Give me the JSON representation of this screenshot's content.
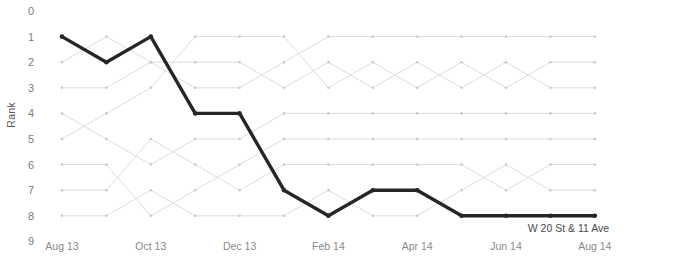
{
  "chart_data": {
    "type": "line",
    "subtype": "bump-chart",
    "title": "",
    "xlabel": "",
    "ylabel": "Rank",
    "x": [
      "Aug 13",
      "Sep 13",
      "Oct 13",
      "Nov 13",
      "Dec 13",
      "Jan 14",
      "Feb 14",
      "Mar 14",
      "Apr 14",
      "May 14",
      "Jun 14",
      "Jul 14",
      "Aug 14"
    ],
    "x_tick_labels": [
      "Aug 13",
      "Oct 13",
      "Dec 13",
      "Feb 14",
      "Apr 14",
      "Jun 14",
      "Aug 14"
    ],
    "x_tick_indices": [
      0,
      2,
      4,
      6,
      8,
      10,
      12
    ],
    "y_tick_labels": [
      "0",
      "1",
      "2",
      "3",
      "4",
      "5",
      "6",
      "7",
      "8",
      "9"
    ],
    "ylim": [
      0,
      9
    ],
    "y_inverted": true,
    "grid": false,
    "legend": "none",
    "highlight_color": "#262626",
    "muted_color": "#d9d9d9",
    "annotations": [
      {
        "text": "W 20 St & 11 Ave",
        "series": "W 20 St & 11 Ave",
        "at_x": "Aug 14",
        "at_y": 8
      }
    ],
    "series": [
      {
        "name": "W 20 St & 11 Ave",
        "highlighted": true,
        "values": [
          1,
          2,
          1,
          4,
          4,
          7,
          8,
          7,
          7,
          8,
          8,
          8,
          8
        ]
      },
      {
        "name": "series-2",
        "highlighted": false,
        "values": [
          2,
          1,
          2,
          3,
          3,
          2,
          1,
          1,
          1,
          1,
          1,
          1,
          1
        ]
      },
      {
        "name": "series-3",
        "highlighted": false,
        "values": [
          3,
          3,
          2,
          2,
          2,
          3,
          2,
          3,
          2,
          3,
          2,
          3,
          3
        ]
      },
      {
        "name": "series-4",
        "highlighted": false,
        "values": [
          4,
          5,
          6,
          5,
          5,
          4,
          4,
          4,
          4,
          4,
          4,
          4,
          4
        ]
      },
      {
        "name": "series-5",
        "highlighted": false,
        "values": [
          5,
          4,
          3,
          1,
          1,
          1,
          3,
          2,
          3,
          2,
          3,
          2,
          2
        ]
      },
      {
        "name": "series-6",
        "highlighted": false,
        "values": [
          6,
          6,
          8,
          7,
          6,
          5,
          5,
          5,
          5,
          5,
          5,
          5,
          5
        ]
      },
      {
        "name": "series-7",
        "highlighted": false,
        "values": [
          7,
          7,
          5,
          6,
          7,
          6,
          6,
          6,
          6,
          6,
          7,
          6,
          6
        ]
      },
      {
        "name": "series-8",
        "highlighted": false,
        "values": [
          8,
          8,
          7,
          8,
          8,
          8,
          7,
          8,
          8,
          7,
          6,
          7,
          7
        ]
      }
    ]
  }
}
